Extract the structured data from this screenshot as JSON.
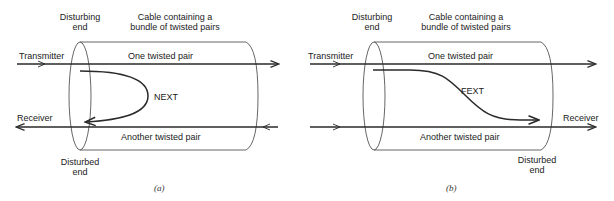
{
  "figure": {
    "colors": {
      "line": "#2a2a2a",
      "text": "#222222",
      "background": "#ffffff"
    },
    "panels": [
      {
        "id": "a",
        "caption": "(a)",
        "labels": {
          "disturbing_end_1": "Disturbing",
          "disturbing_end_2": "end",
          "cable_1": "Cable containing a",
          "cable_2": "bundle of twisted pairs",
          "transmitter": "Transmitter",
          "one_pair": "One twisted pair",
          "crosstalk": "NEXT",
          "receiver": "Receiver",
          "another_pair": "Another twisted pair",
          "disturbed_end_1": "Disturbed",
          "disturbed_end_2": "end"
        }
      },
      {
        "id": "b",
        "caption": "(b)",
        "labels": {
          "disturbing_end_1": "Disturbing",
          "disturbing_end_2": "end",
          "cable_1": "Cable containing a",
          "cable_2": "bundle of twisted pairs",
          "transmitter": "Transmitter",
          "one_pair": "One twisted pair",
          "crosstalk": "FEXT",
          "receiver": "Receiver",
          "another_pair": "Another twisted pair",
          "disturbed_end_1": "Disturbed",
          "disturbed_end_2": "end"
        }
      }
    ]
  }
}
